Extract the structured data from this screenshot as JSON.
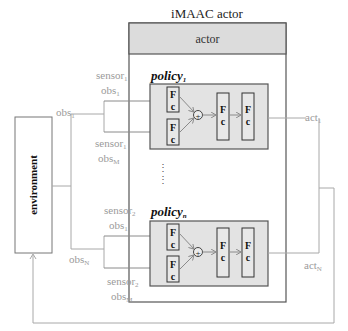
{
  "title": "iMAAC actor",
  "actor_header": "actor",
  "environment_label": "environment",
  "colors": {
    "header_fill": "#dcdcdc",
    "policy_fill": "#e3e3e3",
    "box_stroke": "#555555",
    "wire": "#a8a8a8",
    "label_gray": "#9a9a9a"
  },
  "policies": [
    {
      "name": "policy",
      "subscript": "1",
      "inputs": [
        {
          "sensor": "sensor",
          "sensor_sub": "1",
          "obs": "obs",
          "obs_sub": "1"
        },
        {
          "sensor": "sensor",
          "sensor_sub": "1",
          "obs": "obs",
          "obs_sub": "M"
        }
      ],
      "agent_obs": {
        "label": "obs",
        "sub": "1"
      },
      "output": {
        "label": "act",
        "sub": "1"
      }
    },
    {
      "name": "policy",
      "subscript": "n",
      "inputs": [
        {
          "sensor": "sensor",
          "sensor_sub": "2",
          "obs": "obs",
          "obs_sub": "1"
        },
        {
          "sensor": "sensor",
          "sensor_sub": "2",
          "obs": "obs",
          "obs_sub": "M"
        }
      ],
      "agent_obs": {
        "label": "obs",
        "sub": "N"
      },
      "output": {
        "label": "act",
        "sub": "N"
      }
    }
  ],
  "fc_layer": {
    "top": "F",
    "bottom": "c"
  },
  "merge_symbol": "+",
  "ellipsis": "⋮"
}
